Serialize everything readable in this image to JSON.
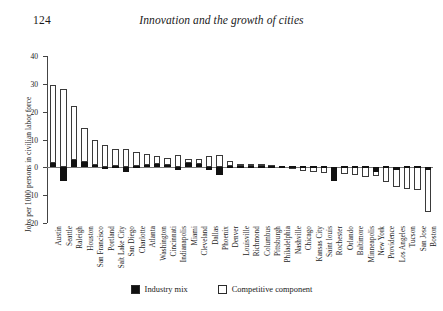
{
  "page": {
    "folio": "124",
    "running_title": "Innovation and the growth of cities"
  },
  "legend": {
    "industry_mix": "Industry mix",
    "competitive_component": "Competitive component"
  },
  "colors": {
    "industry_mix": "#111111",
    "competitive_component": "#ffffff",
    "axis": "#444444"
  },
  "chart_data": {
    "type": "bar",
    "title": "",
    "xlabel": "",
    "ylabel": "Jobs per 1000 persons in civilian labor force",
    "ylim": [
      -20,
      40
    ],
    "yticks": [
      40,
      30,
      20,
      10,
      0,
      -10,
      -20
    ],
    "ytick_labels": [
      "40",
      "30",
      "20",
      "10",
      "0",
      "–10",
      "–20"
    ],
    "grid": false,
    "legend_position": "bottom-center",
    "stacked": true,
    "categories": [
      "Austin",
      "Seattle",
      "Raleigh",
      "Houston",
      "San Francisco",
      "Portland",
      "Salt Lake City",
      "San Diego",
      "Charlotte",
      "Atlanta",
      "Washington",
      "Cincinnati",
      "Indianapolis",
      "Miami",
      "Cleveland",
      "Dallas",
      "Phoenix",
      "Denver",
      "Louisville",
      "Richmond",
      "Columbus",
      "Pittsburgh",
      "Philadelphia",
      "Nashville",
      "Chicago",
      "Kansas City",
      "Saint louis",
      "Rochester",
      "Orlando",
      "Baltimore",
      "Minneapolis",
      "New York",
      "Providence",
      "Los Angeles",
      "Tucson",
      "San Jose",
      "Boston"
    ],
    "series": [
      {
        "name": "Industry mix",
        "values": [
          1.5,
          -5.0,
          2.5,
          1.8,
          0.8,
          -0.6,
          0.6,
          -1.5,
          0.5,
          0.7,
          1.2,
          1.0,
          -0.8,
          1.5,
          1.3,
          -0.8,
          -2.8,
          0.4,
          0.3,
          0.4,
          0.5,
          0.4,
          0.4,
          0.4,
          0.3,
          0.4,
          0.4,
          -5.0,
          0.5,
          0.5,
          0.4,
          -1.5,
          0.4,
          -0.8,
          0.3,
          0.4,
          -1.0
        ]
      },
      {
        "name": "Competitive component",
        "values": [
          28.0,
          28.0,
          19.5,
          12.2,
          9.0,
          8.0,
          6.0,
          6.5,
          5.0,
          4.0,
          2.8,
          2.5,
          4.3,
          1.5,
          1.8,
          4.0,
          4.5,
          2.0,
          1.0,
          0.9,
          0.6,
          0.4,
          -0.4,
          -1.0,
          -1.6,
          -2.0,
          -2.5,
          -0.2,
          -3.0,
          -3.4,
          -4.0,
          -3.0,
          -5.5,
          -7.2,
          -8.2,
          -8.6,
          -16.0
        ]
      }
    ],
    "totals": [
      29.5,
      23.0,
      22.0,
      14.0,
      9.8,
      7.4,
      6.6,
      5.0,
      5.5,
      4.7,
      4.0,
      3.5,
      3.5,
      3.0,
      3.1,
      3.2,
      1.7,
      2.4,
      1.3,
      1.3,
      1.1,
      0.8,
      -0.4,
      -1.0,
      -1.6,
      -2.0,
      -2.5,
      -5.2,
      -2.5,
      -2.9,
      -3.6,
      -4.5,
      -5.1,
      -8.0,
      -7.9,
      -8.2,
      -17.0
    ]
  }
}
